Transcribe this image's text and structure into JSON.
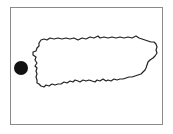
{
  "map": {
    "subject": "Puerto Rico island outline",
    "frame_color": "#8a8a8a",
    "outline_color": "#222222",
    "land_fill": "#ffffff",
    "marker": {
      "icon": "location-dot-icon",
      "position": "west of island",
      "color": "#111111"
    }
  }
}
